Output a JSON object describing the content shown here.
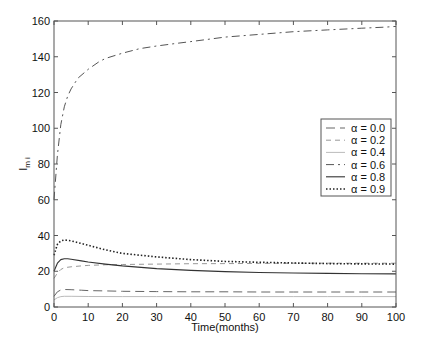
{
  "chart_data": {
    "type": "line",
    "title": "",
    "xlabel": "Time(months)",
    "ylabel": "I",
    "ylabel_sub": "m i",
    "xlim": [
      0,
      100
    ],
    "ylim": [
      0,
      160
    ],
    "xticks": [
      0,
      10,
      20,
      30,
      40,
      50,
      60,
      70,
      80,
      90,
      100
    ],
    "yticks": [
      0,
      20,
      40,
      60,
      80,
      100,
      120,
      140,
      160
    ],
    "grid": false,
    "legend_position": "center-right",
    "series": [
      {
        "name": "α = 0.0",
        "style": "long-dash",
        "color": "#666666",
        "x": [
          0,
          1,
          2,
          3,
          5,
          8,
          10,
          15,
          20,
          30,
          40,
          50,
          60,
          70,
          80,
          90,
          100
        ],
        "y": [
          6,
          8.5,
          9.5,
          9.8,
          9.7,
          9.4,
          9.2,
          9.0,
          8.8,
          8.6,
          8.5,
          8.5,
          8.4,
          8.4,
          8.4,
          8.4,
          8.4
        ]
      },
      {
        "name": "α = 0.2",
        "style": "dashed",
        "color": "#999999",
        "x": [
          0,
          1,
          2,
          3,
          5,
          8,
          10,
          15,
          20,
          30,
          40,
          50,
          60,
          70,
          80,
          90,
          100
        ],
        "y": [
          16,
          19,
          21,
          22,
          22.5,
          23,
          23.3,
          23.6,
          23.8,
          24,
          24.2,
          24.3,
          24.4,
          24.5,
          24.5,
          24.5,
          24.5
        ]
      },
      {
        "name": "α = 0.4",
        "style": "solid-light",
        "color": "#bbbbbb",
        "x": [
          0,
          1,
          2,
          3,
          5,
          10,
          20,
          30,
          40,
          50,
          60,
          70,
          80,
          90,
          100
        ],
        "y": [
          4,
          5.2,
          5.8,
          6.0,
          6.0,
          5.9,
          5.8,
          5.8,
          5.8,
          5.8,
          5.8,
          5.8,
          5.8,
          5.8,
          5.8
        ]
      },
      {
        "name": "α = 0.6",
        "style": "dash-dot",
        "color": "#555555",
        "x": [
          0,
          1,
          2,
          3,
          4,
          5,
          7,
          10,
          13,
          15,
          20,
          25,
          30,
          36,
          40,
          50,
          60,
          70,
          80,
          90,
          97,
          100
        ],
        "y": [
          60,
          85,
          102,
          112,
          118,
          122,
          128,
          133,
          137,
          139,
          142,
          144.5,
          146,
          147.5,
          148.5,
          151,
          152.5,
          154,
          155,
          156,
          156.6,
          157
        ]
      },
      {
        "name": "α = 0.8",
        "style": "solid",
        "color": "#333333",
        "x": [
          0,
          1,
          2,
          3,
          4,
          5,
          8,
          10,
          15,
          20,
          30,
          40,
          50,
          60,
          70,
          80,
          90,
          100
        ],
        "y": [
          20,
          24.5,
          26.5,
          27,
          27,
          26.7,
          25.8,
          25.2,
          24,
          23,
          21.5,
          20.5,
          19.8,
          19.3,
          19,
          18.8,
          18.6,
          18.5
        ]
      },
      {
        "name": "α = 0.9",
        "style": "dotted",
        "color": "#222222",
        "x": [
          0,
          1,
          2,
          3,
          4,
          5,
          8,
          10,
          15,
          20,
          30,
          40,
          50,
          60,
          70,
          80,
          90,
          100
        ],
        "y": [
          29,
          35,
          37,
          37.5,
          37.3,
          37,
          35.5,
          34.5,
          32,
          30,
          28,
          26.5,
          25.5,
          25,
          24.6,
          24.3,
          24.1,
          24
        ]
      }
    ]
  }
}
